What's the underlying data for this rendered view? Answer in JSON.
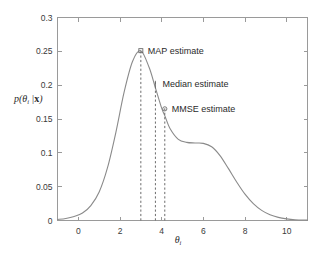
{
  "chart_data": {
    "type": "line",
    "title": "",
    "subtitle": "",
    "xlabel": "θᵢ",
    "ylabel": "p(θᵢ | x)",
    "xlim": [
      -1,
      11
    ],
    "ylim": [
      0,
      0.3
    ],
    "grid": false,
    "legend_position": "none",
    "x_ticks": [
      "0",
      "2",
      "4",
      "6",
      "8",
      "10"
    ],
    "x_tick_values": [
      0,
      2,
      4,
      6,
      8,
      10
    ],
    "y_ticks": [
      "0",
      "0.05",
      "0.1",
      "0.15",
      "0.2",
      "0.25",
      "0.3"
    ],
    "y_tick_values": [
      0,
      0.05,
      0.1,
      0.15,
      0.2,
      0.25,
      0.3
    ],
    "series": [
      {
        "name": "posterior density",
        "color": "#8a8a8a",
        "x": [
          -1.0,
          -0.6,
          -0.2,
          0.2,
          0.6,
          1.0,
          1.4,
          1.8,
          2.2,
          2.6,
          3.0,
          3.4,
          3.7,
          4.0,
          4.15,
          4.4,
          4.8,
          5.2,
          5.6,
          6.0,
          6.4,
          6.8,
          7.2,
          7.6,
          8.0,
          8.4,
          8.8,
          9.2,
          9.6,
          10.0,
          10.4,
          11.0
        ],
        "values": [
          0.0015,
          0.003,
          0.006,
          0.011,
          0.022,
          0.042,
          0.078,
          0.13,
          0.19,
          0.235,
          0.251,
          0.226,
          0.196,
          0.166,
          0.155,
          0.136,
          0.12,
          0.1155,
          0.1145,
          0.114,
          0.109,
          0.096,
          0.077,
          0.057,
          0.039,
          0.025,
          0.015,
          0.0085,
          0.0046,
          0.0024,
          0.0012,
          0.0005
        ]
      }
    ],
    "annotations": [
      {
        "id": "map",
        "label": "MAP estimate",
        "x": 3.0,
        "y": 0.251,
        "marker": "square",
        "dashed_line": true
      },
      {
        "id": "median",
        "label": "Median estimate",
        "x": 3.7,
        "y": 0.202,
        "marker": "tick",
        "dashed_line": true
      },
      {
        "id": "mmse",
        "label": "MMSE estimate",
        "x": 4.15,
        "y": 0.165,
        "marker": "circle",
        "dashed_line": true
      }
    ]
  },
  "axes": {
    "y_label_text": "p(θᵢ | x)",
    "y_label_p": "p",
    "y_label_theta": "θ",
    "y_label_sub": "i",
    "y_label_bar": "|",
    "y_label_x": "x",
    "x_label_theta": "θ",
    "x_label_sub": "i"
  }
}
